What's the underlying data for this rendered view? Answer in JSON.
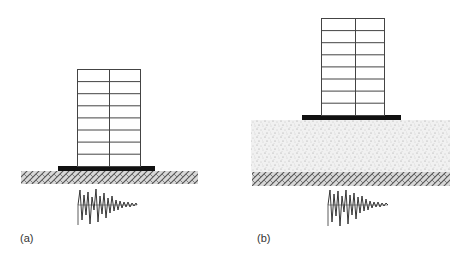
{
  "figure": {
    "panels": [
      {
        "id": "a",
        "label": "(a)",
        "description": "Building on foundation slab directly on bedrock, seismic input",
        "stories": 8,
        "bays": 2
      },
      {
        "id": "b",
        "label": "(b)",
        "description": "Building on foundation slab over soil layer above bedrock, seismic input",
        "stories": 8,
        "bays": 2
      }
    ],
    "colors": {
      "line": "#333333",
      "slab": "#111111",
      "hatch": "#666666",
      "soil_dots": "#9a9a9a",
      "background": "#ffffff"
    }
  }
}
